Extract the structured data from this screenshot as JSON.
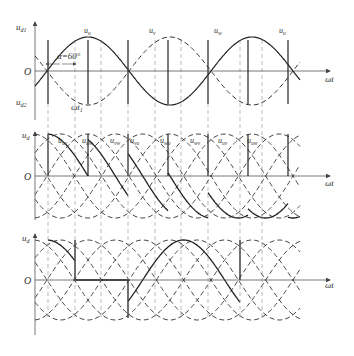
{
  "diagram": {
    "type": "three-phase rectifier waveforms",
    "colors": {
      "line": "#222222",
      "dashed": "#333333",
      "axis": "#555555",
      "background": "#ffffff"
    },
    "panel1": {
      "y_label_top": "u",
      "y_label_top_sub": "d1",
      "y_label_bottom": "u",
      "y_label_bottom_sub": "d2",
      "origin": "O",
      "x_label": "ωt",
      "alpha_label": "α=60°",
      "omega_t1": "ωt",
      "omega_t1_sub": "1",
      "phase_labels": [
        {
          "base": "u",
          "sub": "u"
        },
        {
          "base": "u",
          "sub": "v"
        },
        {
          "base": "u",
          "sub": "w"
        },
        {
          "base": "u",
          "sub": "u"
        }
      ]
    },
    "panel2": {
      "y_label": "u",
      "y_label_sub": "d",
      "origin": "O",
      "x_label": "ωt",
      "line_labels": [
        {
          "base": "u",
          "sub": "uv"
        },
        {
          "base": "u",
          "sub": "uw"
        },
        {
          "base": "u",
          "sub": "vw"
        },
        {
          "base": "u",
          "sub": "vu"
        },
        {
          "base": "u",
          "sub": "wu"
        },
        {
          "base": "u",
          "sub": "wv"
        },
        {
          "base": "u",
          "sub": "uv"
        },
        {
          "base": "u",
          "sub": "uw"
        }
      ]
    },
    "panel3": {
      "y_label": "u",
      "y_label_sub": "d",
      "origin": "O",
      "x_label": "ωt"
    }
  }
}
